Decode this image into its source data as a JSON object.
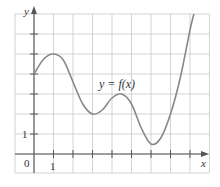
{
  "chart_data": {
    "type": "line",
    "title": "",
    "xlabel": "x",
    "ylabel": "y",
    "curve_label": "y = f(x)",
    "origin_label": "0",
    "x_tick_label": "1",
    "y_tick_label": "1",
    "xlim": [
      -1,
      9
    ],
    "ylim": [
      -1,
      7
    ],
    "grid": true,
    "x_ticks": [
      1,
      2,
      3,
      4,
      5,
      6,
      7,
      8
    ],
    "y_ticks": [
      1,
      2,
      3,
      4,
      5,
      6
    ],
    "series": [
      {
        "name": "f(x)",
        "x": [
          0,
          0.5,
          1,
          1.5,
          2,
          2.5,
          3,
          3.5,
          4,
          4.5,
          5,
          5.5,
          6,
          6.5,
          7,
          7.5,
          8,
          8.2
        ],
        "values": [
          4,
          4.75,
          5,
          4.7,
          3.6,
          2.5,
          2.0,
          2.2,
          2.8,
          3.0,
          2.5,
          1.3,
          0.5,
          0.8,
          2.0,
          3.8,
          6.2,
          7.0
        ]
      }
    ]
  },
  "colors": {
    "grid": "#c8c8c8",
    "axis": "#555555",
    "curve": "#888888",
    "text": "#333333"
  }
}
